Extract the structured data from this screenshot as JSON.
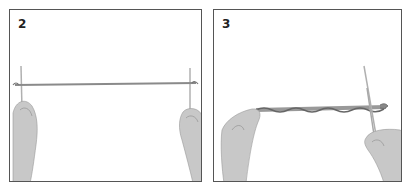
{
  "panels": [
    {
      "step": "2",
      "description": "Two hands holding two knitting needles far apart with a taut strand of yarn stretched between them"
    },
    {
      "step": "3",
      "description": "Left hand holding one end of a twisted yarn cord; right hand holding two knitting needles at the other end"
    }
  ],
  "colors": {
    "border": "#555555",
    "skin": "#c8c8c8",
    "yarn": "#8a8a8a",
    "needle": "#b0b0b0"
  }
}
